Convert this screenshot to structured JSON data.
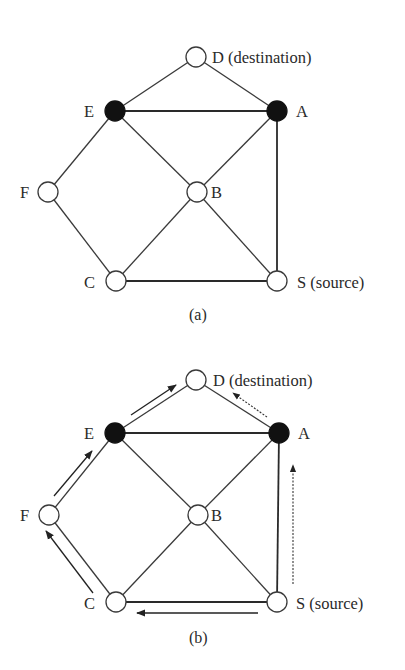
{
  "panels": [
    {
      "caption": "(a)",
      "nodes": [
        {
          "id": "D",
          "label": "D (destination)",
          "filled": false
        },
        {
          "id": "E",
          "label": "E",
          "filled": true
        },
        {
          "id": "A",
          "label": "A",
          "filled": true
        },
        {
          "id": "F",
          "label": "F",
          "filled": false
        },
        {
          "id": "B",
          "label": "B",
          "filled": false
        },
        {
          "id": "C",
          "label": "C",
          "filled": false
        },
        {
          "id": "S",
          "label": "S (source)",
          "filled": false
        }
      ],
      "edges": [
        [
          "E",
          "D"
        ],
        [
          "D",
          "A"
        ],
        [
          "E",
          "A"
        ],
        [
          "E",
          "F"
        ],
        [
          "E",
          "B"
        ],
        [
          "A",
          "B"
        ],
        [
          "A",
          "S"
        ],
        [
          "F",
          "C"
        ],
        [
          "B",
          "C"
        ],
        [
          "B",
          "S"
        ],
        [
          "C",
          "S"
        ]
      ]
    },
    {
      "caption": "(b)",
      "nodes": [
        {
          "id": "D",
          "label": "D (destination)",
          "filled": false
        },
        {
          "id": "E",
          "label": "E",
          "filled": true
        },
        {
          "id": "A",
          "label": "A",
          "filled": true
        },
        {
          "id": "F",
          "label": "F",
          "filled": false
        },
        {
          "id": "B",
          "label": "B",
          "filled": false
        },
        {
          "id": "C",
          "label": "C",
          "filled": false
        },
        {
          "id": "S",
          "label": "S (source)",
          "filled": false
        }
      ],
      "edges": [
        [
          "E",
          "D"
        ],
        [
          "D",
          "A"
        ],
        [
          "E",
          "A"
        ],
        [
          "E",
          "F"
        ],
        [
          "E",
          "B"
        ],
        [
          "A",
          "B"
        ],
        [
          "A",
          "S"
        ],
        [
          "F",
          "C"
        ],
        [
          "B",
          "C"
        ],
        [
          "B",
          "S"
        ],
        [
          "C",
          "S"
        ]
      ],
      "arrows": [
        {
          "from": "S",
          "to": "C",
          "style": "solid"
        },
        {
          "from": "C",
          "to": "F",
          "style": "solid"
        },
        {
          "from": "F",
          "to": "E",
          "style": "solid"
        },
        {
          "from": "E",
          "to": "D",
          "style": "solid"
        },
        {
          "from": "S",
          "to": "A",
          "style": "dotted"
        },
        {
          "from": "A",
          "to": "D",
          "style": "dotted"
        }
      ]
    }
  ]
}
